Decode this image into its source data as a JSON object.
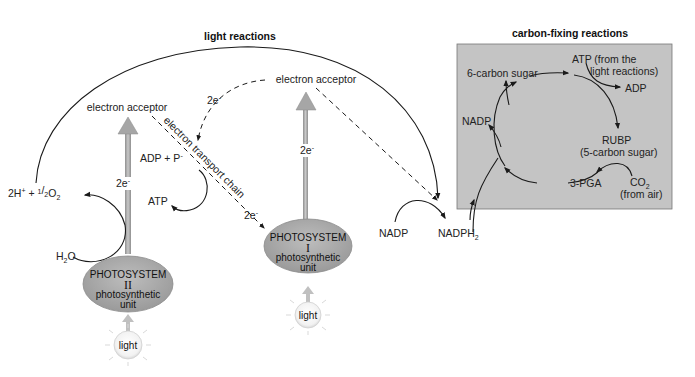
{
  "light_reactions": {
    "title": "light reactions",
    "electron_acceptor_left": "electron acceptor",
    "electron_acceptor_right": "electron acceptor",
    "electron_transport_chain": "electron transport chain",
    "two_e_ps2": "2e",
    "two_e_top": "2e",
    "two_e_etc": "2e",
    "two_e_ps1": "2e",
    "minus": "-",
    "adp_p": "ADP + P",
    "atp": "ATP",
    "products_water": "2H",
    "products_water_plus": "+",
    "half": "1/2",
    "o2": "O",
    "sub2": "2",
    "h2o_h": "H",
    "h2o_o": "O",
    "photosystem_2": {
      "line1": "PHOTOSYSTEM",
      "roman": "II",
      "line2": "photosynthetic",
      "line3": "unit"
    },
    "photosystem_1": {
      "line1": "PHOTOSYSTEM",
      "roman": "I",
      "line2": "photosynthetic",
      "line3": "unit"
    },
    "light_1": "light",
    "light_2": "light",
    "nadp": "NADP",
    "nadph": "NADPH"
  },
  "carbon_fixing": {
    "title": "carbon-fixing reactions",
    "six_carbon_sugar": "6-carbon sugar",
    "atp_line1": "ATP (from the",
    "atp_line2": "light reactions)",
    "adp": "ADP",
    "nadp": "NADP",
    "rubp": "RUBP",
    "rubp_sub": "(5-carbon sugar)",
    "pga": "3-PGA",
    "co2": "CO",
    "co2_sub": "2",
    "co2_src": "(from air)"
  },
  "colors": {
    "box_fill": "#c4c4c4",
    "ellipse_fill": "#a8a8a8",
    "arrow_fill": "#b0b0b0",
    "line": "#1a1a1a"
  }
}
